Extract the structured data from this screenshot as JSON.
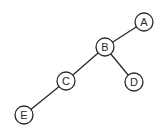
{
  "diagram": {
    "type": "binary-tree",
    "nodes": [
      {
        "id": "A",
        "label": "A",
        "x": 144,
        "y": 22
      },
      {
        "id": "B",
        "label": "B",
        "x": 105,
        "y": 47
      },
      {
        "id": "C",
        "label": "C",
        "x": 66,
        "y": 81
      },
      {
        "id": "D",
        "label": "D",
        "x": 134,
        "y": 82
      },
      {
        "id": "E",
        "label": "E",
        "x": 24,
        "y": 115
      }
    ],
    "edges": [
      {
        "from": "A",
        "to": "B"
      },
      {
        "from": "B",
        "to": "C"
      },
      {
        "from": "B",
        "to": "D"
      },
      {
        "from": "C",
        "to": "E"
      }
    ],
    "node_radius": 9,
    "colors": {
      "stroke": "#2a2a2a",
      "fill": "#ffffff"
    }
  }
}
